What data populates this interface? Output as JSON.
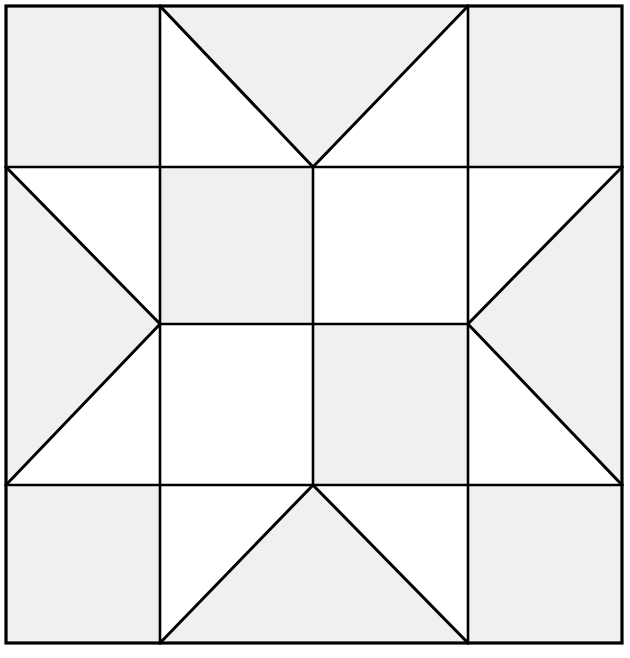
{
  "figure": {
    "kind": "geometric-quilt-block",
    "canvas": {
      "width": 630,
      "height": 658
    }
  },
  "colors": {
    "background": "#ffffff",
    "fill_light": "#ffffff",
    "fill_shade": "#f0f0f0",
    "stroke": "#000000"
  },
  "geometry": {
    "stroke_width_outer": 3.2,
    "stroke_width_grid": 2.6,
    "stroke_width_diagonal": 3.0,
    "x_lines": [
      6,
      160,
      313,
      468,
      622
    ],
    "y_lines": [
      6,
      167,
      324,
      485,
      643
    ],
    "block_left": 6,
    "block_top": 6,
    "block_right": 622,
    "block_bottom": 643
  },
  "shapes": {
    "corners": [
      {
        "name": "corner-top-left",
        "points": "6,6 160,6 160,167 6,167",
        "fill": "shade"
      },
      {
        "name": "corner-top-right",
        "points": "468,6 622,6 622,167 468,167",
        "fill": "shade"
      },
      {
        "name": "corner-bottom-left",
        "points": "6,485 160,485 160,643 6,643",
        "fill": "shade"
      },
      {
        "name": "corner-bottom-right",
        "points": "468,485 622,485 622,643 468,643",
        "fill": "shade"
      }
    ],
    "points": [
      {
        "name": "star-point-top",
        "points": "160,6 468,6 313,167",
        "fill": "shade",
        "direction": "down"
      },
      {
        "name": "star-point-bottom",
        "points": "160,643 468,643 313,485",
        "fill": "shade",
        "direction": "up"
      },
      {
        "name": "star-point-left",
        "points": "6,167 6,485 160,324",
        "fill": "shade",
        "direction": "right"
      },
      {
        "name": "star-point-right",
        "points": "622,167 622,485 468,324",
        "fill": "shade",
        "direction": "left"
      }
    ],
    "point_background": [
      {
        "name": "star-point-top-bg-left",
        "points": "160,6 313,167 160,167",
        "fill": "light"
      },
      {
        "name": "star-point-top-bg-right",
        "points": "468,6 468,167 313,167",
        "fill": "light"
      },
      {
        "name": "star-point-bottom-bg-left",
        "points": "160,643 160,485 313,485",
        "fill": "light"
      },
      {
        "name": "star-point-bottom-bg-right",
        "points": "468,643 313,485 468,485",
        "fill": "light"
      },
      {
        "name": "star-point-left-bg-top",
        "points": "6,167 160,324 160,167",
        "fill": "light"
      },
      {
        "name": "star-point-left-bg-bottom",
        "points": "6,485 160,485 160,324",
        "fill": "light"
      },
      {
        "name": "star-point-right-bg-top",
        "points": "622,167 468,167 468,324",
        "fill": "light"
      },
      {
        "name": "star-point-right-bg-bottom",
        "points": "622,485 468,324 468,485",
        "fill": "light"
      }
    ],
    "center": [
      {
        "name": "center-cell-top-left",
        "points": "160,167 313,167 313,324 160,324",
        "fill": "shade"
      },
      {
        "name": "center-cell-top-right",
        "points": "313,167 468,167 468,324 313,324",
        "fill": "light"
      },
      {
        "name": "center-cell-bottom-left",
        "points": "160,324 313,324 313,485 160,485",
        "fill": "light"
      },
      {
        "name": "center-cell-bottom-right",
        "points": "313,324 468,324 468,485 313,485",
        "fill": "shade"
      }
    ]
  },
  "lines": {
    "grid_vertical": [
      {
        "name": "grid-line-v-1",
        "x": 160,
        "y1": 6,
        "y2": 643
      },
      {
        "name": "grid-line-v-2",
        "x": 313,
        "y1": 167,
        "y2": 485
      },
      {
        "name": "grid-line-v-3",
        "x": 468,
        "y1": 6,
        "y2": 643
      }
    ],
    "grid_horizontal": [
      {
        "name": "grid-line-h-1",
        "y": 167,
        "x1": 6,
        "x2": 622
      },
      {
        "name": "grid-line-h-2",
        "y": 324,
        "x1": 160,
        "x2": 468
      },
      {
        "name": "grid-line-h-3",
        "y": 485,
        "x1": 6,
        "x2": 622
      }
    ],
    "diagonals": [
      {
        "name": "diagonal-top-left",
        "x1": 160,
        "y1": 6,
        "x2": 313,
        "y2": 167
      },
      {
        "name": "diagonal-top-right",
        "x1": 468,
        "y1": 6,
        "x2": 313,
        "y2": 167
      },
      {
        "name": "diagonal-bottom-left",
        "x1": 160,
        "y1": 643,
        "x2": 313,
        "y2": 485
      },
      {
        "name": "diagonal-bottom-right",
        "x1": 468,
        "y1": 643,
        "x2": 313,
        "y2": 485
      },
      {
        "name": "diagonal-left-top",
        "x1": 6,
        "y1": 167,
        "x2": 160,
        "y2": 324
      },
      {
        "name": "diagonal-left-bottom",
        "x1": 6,
        "y1": 485,
        "x2": 160,
        "y2": 324
      },
      {
        "name": "diagonal-right-top",
        "x1": 622,
        "y1": 167,
        "x2": 468,
        "y2": 324
      },
      {
        "name": "diagonal-right-bottom",
        "x1": 622,
        "y1": 485,
        "x2": 468,
        "y2": 324
      }
    ],
    "border": {
      "name": "block-border",
      "x": 6,
      "y": 6,
      "width": 616,
      "height": 637
    }
  }
}
